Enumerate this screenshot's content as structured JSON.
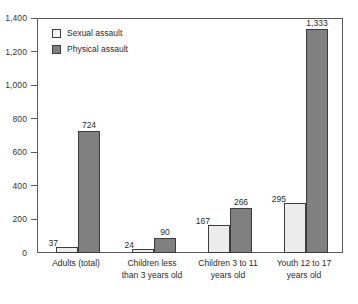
{
  "chart_data": {
    "type": "bar",
    "title": "",
    "subtitle": "",
    "xlabel": "",
    "ylabel": "",
    "ylim": [
      0,
      1400
    ],
    "grid": false,
    "legend_position": "top-left",
    "categories": [
      "Adults (total)",
      "Children less than 3 years old",
      "Children 3 to 11 years old",
      "Youth 12 to 17 years old"
    ],
    "category_lines": [
      [
        "Adults (total)"
      ],
      [
        "Children less",
        "than 3 years old"
      ],
      [
        "Children 3 to 11",
        "years old"
      ],
      [
        "Youth 12 to 17",
        "years old"
      ]
    ],
    "series": [
      {
        "name": "Sexual assault",
        "color": "#ececec",
        "values": [
          37,
          24,
          167,
          295
        ],
        "labels": [
          "37",
          "24",
          "167",
          "295"
        ]
      },
      {
        "name": "Physical assault",
        "color": "#808080",
        "values": [
          724,
          90,
          266,
          1333
        ],
        "labels": [
          "724",
          "90",
          "266",
          "1,333"
        ]
      }
    ],
    "y_ticks": [
      0,
      200,
      400,
      600,
      800,
      1000,
      1200,
      1400
    ],
    "y_tick_labels": [
      "0",
      "200",
      "400",
      "600",
      "800",
      "1,000",
      "1,200",
      "1,400"
    ]
  },
  "legend": {
    "items": [
      {
        "label": "Sexual assault",
        "swatch": "sexual"
      },
      {
        "label": "Physical assault",
        "swatch": "physical"
      }
    ]
  },
  "colors": {
    "sexual_assault": "#ececec",
    "physical_assault": "#808080",
    "axis": "#5a5a5a",
    "text": "#2b2b2b",
    "background": "#ffffff"
  }
}
